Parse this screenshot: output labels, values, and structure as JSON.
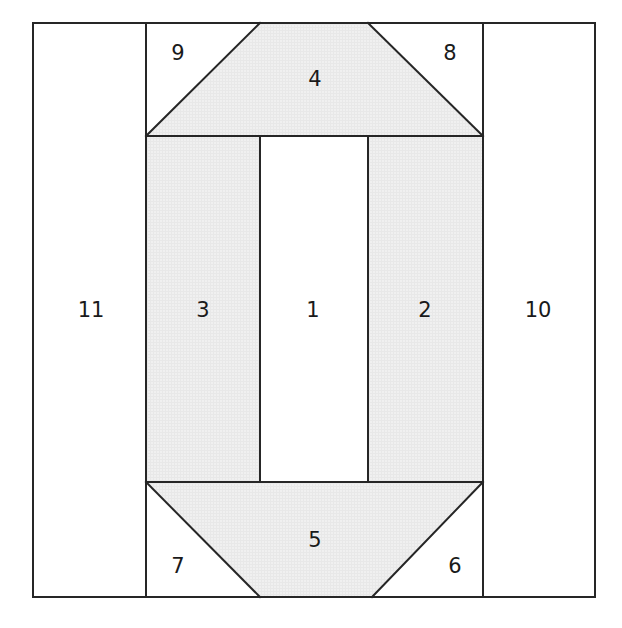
{
  "figure": {
    "canvas": {
      "width": 622,
      "height": 628
    },
    "style": {
      "stroke_color": "#262626",
      "stroke_width": 2.0,
      "shaded_fill": "#efefef",
      "unshaded_fill": "#ffffff",
      "label_color": "#1a1a1a",
      "label_font_size": 21,
      "background": "#ffffff"
    },
    "outer_rectangle": {
      "x1": 33,
      "y1": 23,
      "x2": 595,
      "y2": 597
    },
    "guides": {
      "vertical_x": [
        146,
        260,
        368,
        483
      ],
      "horizontal_y": [
        136,
        482
      ]
    },
    "regions": [
      {
        "id": "region-1",
        "label": "1",
        "shape": "rectangle",
        "shaded": false,
        "label_x": 313,
        "label_y": 311,
        "points": "260,136 368,136 368,482 260,482"
      },
      {
        "id": "region-2",
        "label": "2",
        "shape": "rectangle",
        "shaded": true,
        "label_x": 425,
        "label_y": 311,
        "points": "368,136 483,136 483,482 368,482"
      },
      {
        "id": "region-3",
        "label": "3",
        "shape": "rectangle",
        "shaded": true,
        "label_x": 203,
        "label_y": 311,
        "points": "146,136 260,136 260,482 146,482"
      },
      {
        "id": "region-4",
        "label": "4",
        "shape": "trapezoid",
        "shaded": true,
        "label_x": 315,
        "label_y": 80,
        "points": "260,23 368,23 483,136 146,136"
      },
      {
        "id": "region-5",
        "label": "5",
        "shape": "trapezoid",
        "shaded": true,
        "label_x": 315,
        "label_y": 541,
        "points": "146,482 483,482 372,597 260,597"
      },
      {
        "id": "region-6",
        "label": "6",
        "shape": "triangle",
        "shaded": false,
        "label_x": 455,
        "label_y": 567,
        "points": "483,482 483,597 372,597"
      },
      {
        "id": "region-7",
        "label": "7",
        "shape": "triangle",
        "shaded": false,
        "label_x": 178,
        "label_y": 567,
        "points": "146,482 260,597 146,597"
      },
      {
        "id": "region-8",
        "label": "8",
        "shape": "triangle",
        "shaded": false,
        "label_x": 450,
        "label_y": 54,
        "points": "368,23 483,23 483,136"
      },
      {
        "id": "region-9",
        "label": "9",
        "shape": "triangle",
        "shaded": false,
        "label_x": 178,
        "label_y": 54,
        "points": "146,23 260,23 146,136"
      },
      {
        "id": "region-10",
        "label": "10",
        "shape": "rectangle",
        "shaded": false,
        "label_x": 538,
        "label_y": 311,
        "points": "483,23 595,23 595,597 483,597"
      },
      {
        "id": "region-11",
        "label": "11",
        "shape": "rectangle",
        "shaded": false,
        "label_x": 91,
        "label_y": 311,
        "points": "33,23 146,23 146,597 33,597"
      }
    ],
    "edges": [
      {
        "id": "outer-top",
        "x1": 33,
        "y1": 23,
        "x2": 595,
        "y2": 23
      },
      {
        "id": "outer-right",
        "x1": 595,
        "y1": 23,
        "x2": 595,
        "y2": 597
      },
      {
        "id": "outer-bottom",
        "x1": 33,
        "y1": 597,
        "x2": 595,
        "y2": 597
      },
      {
        "id": "outer-left",
        "x1": 33,
        "y1": 23,
        "x2": 33,
        "y2": 597
      },
      {
        "id": "divider-left-vertical",
        "x1": 146,
        "y1": 23,
        "x2": 146,
        "y2": 597
      },
      {
        "id": "divider-right-vertical",
        "x1": 483,
        "y1": 23,
        "x2": 483,
        "y2": 597
      },
      {
        "id": "core-left-vertical",
        "x1": 260,
        "y1": 136,
        "x2": 260,
        "y2": 482
      },
      {
        "id": "core-right-vertical",
        "x1": 368,
        "y1": 136,
        "x2": 368,
        "y2": 482
      },
      {
        "id": "upper-horizontal",
        "x1": 146,
        "y1": 136,
        "x2": 483,
        "y2": 136
      },
      {
        "id": "lower-horizontal",
        "x1": 146,
        "y1": 482,
        "x2": 483,
        "y2": 482
      },
      {
        "id": "diagonal-top-left",
        "x1": 146,
        "y1": 136,
        "x2": 260,
        "y2": 23
      },
      {
        "id": "diagonal-top-right",
        "x1": 368,
        "y1": 23,
        "x2": 483,
        "y2": 136
      },
      {
        "id": "diagonal-bottom-left",
        "x1": 146,
        "y1": 482,
        "x2": 260,
        "y2": 597
      },
      {
        "id": "diagonal-bottom-right",
        "x1": 483,
        "y1": 482,
        "x2": 372,
        "y2": 597
      }
    ]
  }
}
